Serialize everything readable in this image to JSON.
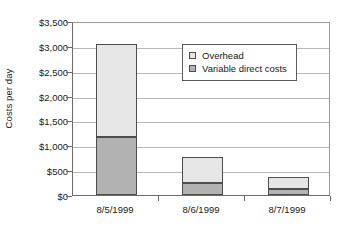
{
  "chart_data": {
    "type": "bar",
    "stacked": true,
    "title": "",
    "xlabel": "",
    "ylabel": "Costs per day",
    "categories": [
      "8/5/1999",
      "8/6/1999",
      "8/7/1999"
    ],
    "series": [
      {
        "name": "Variable direct costs",
        "values": [
          1170,
          250,
          125
        ],
        "color": "#b2b2b2"
      },
      {
        "name": "Overhead",
        "values": [
          1870,
          510,
          235
        ],
        "color": "#e6e6e6"
      }
    ],
    "totals": [
      3040,
      760,
      360
    ],
    "ylim": [
      0,
      3500
    ],
    "ytick_values": [
      0,
      500,
      1000,
      1500,
      2000,
      2500,
      3000,
      3500
    ],
    "ytick_labels": [
      "$0",
      "$500",
      "$1,000",
      "$1,500",
      "$2,000",
      "$2,500",
      "$3,000",
      "$3,500"
    ],
    "grid": true,
    "legend_position": "upper-center",
    "legend_entries": [
      "Overhead",
      "Variable direct costs"
    ]
  }
}
